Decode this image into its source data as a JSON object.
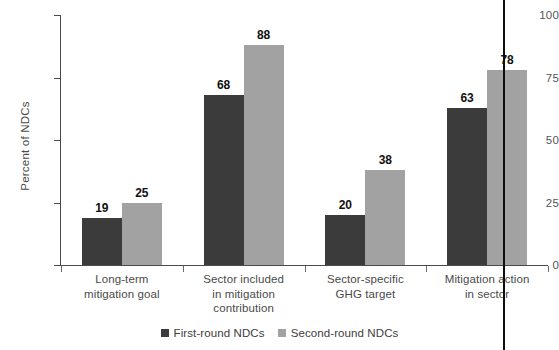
{
  "chart_data": {
    "type": "bar",
    "title": "",
    "xlabel": "",
    "ylabel": "Percent of NDCs",
    "ylim": [
      0,
      100
    ],
    "yticks": [
      "0",
      "25",
      "50",
      "75",
      "100"
    ],
    "ytick_values": [
      0,
      25,
      50,
      75,
      100
    ],
    "grid": false,
    "legend_position": "bottom-center",
    "categories": [
      "Long-term\nmitigation goal",
      "Sector included\nin mitigation\ncontribution",
      "Sector-specific\nGHG target",
      "Mitigation action\nin sector"
    ],
    "category_lines": [
      [
        "Long-term",
        "mitigation goal"
      ],
      [
        "Sector included",
        "in mitigation",
        "contribution"
      ],
      [
        "Sector-specific",
        "GHG target"
      ],
      [
        "Mitigation action",
        "in sector"
      ]
    ],
    "series": [
      {
        "name": "First-round NDCs",
        "color": "#3b3b3b",
        "values": [
          19,
          68,
          20,
          63
        ]
      },
      {
        "name": "Second-round NDCs",
        "color": "#a2a2a2",
        "values": [
          25,
          88,
          38,
          78
        ]
      }
    ]
  },
  "annotations": {
    "binding_line": "vertical-page-fold-line"
  }
}
